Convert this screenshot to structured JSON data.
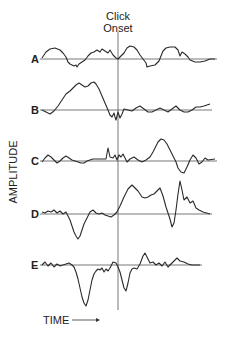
{
  "chart_data": {
    "type": "line",
    "title": "Click Onset",
    "title_lines": [
      "Click",
      "Onset"
    ],
    "xlabel": "TIME",
    "ylabel": "AMPLITUDE",
    "onset_x": 118,
    "onset_line": {
      "y1": 32,
      "y2": 310
    },
    "x_range": [
      28,
      220
    ],
    "grid": false,
    "legend": "none",
    "series": [
      {
        "name": "A",
        "baseline_y": 59,
        "points": [
          [
            42,
            58
          ],
          [
            46,
            52
          ],
          [
            50,
            49
          ],
          [
            55,
            48
          ],
          [
            60,
            50
          ],
          [
            63,
            53
          ],
          [
            66,
            57
          ],
          [
            68,
            62
          ],
          [
            70,
            64
          ],
          [
            72,
            65
          ],
          [
            74,
            66
          ],
          [
            76,
            65
          ],
          [
            77,
            67
          ],
          [
            79,
            64
          ],
          [
            82,
            62
          ],
          [
            85,
            60
          ],
          [
            88,
            56
          ],
          [
            91,
            53
          ],
          [
            94,
            52
          ],
          [
            97,
            50
          ],
          [
            100,
            52
          ],
          [
            102,
            49
          ],
          [
            105,
            51
          ],
          [
            108,
            53
          ],
          [
            110,
            50
          ],
          [
            113,
            55
          ],
          [
            116,
            58
          ],
          [
            118,
            59
          ],
          [
            121,
            56
          ],
          [
            124,
            53
          ],
          [
            127,
            48
          ],
          [
            130,
            46
          ],
          [
            134,
            47
          ],
          [
            137,
            50
          ],
          [
            140,
            55
          ],
          [
            143,
            59
          ],
          [
            146,
            63
          ],
          [
            147,
            67
          ],
          [
            150,
            66
          ],
          [
            155,
            65
          ],
          [
            159,
            61
          ],
          [
            161,
            56
          ],
          [
            163,
            51
          ],
          [
            166,
            48
          ],
          [
            170,
            47
          ],
          [
            175,
            47
          ],
          [
            178,
            50
          ],
          [
            180,
            56
          ],
          [
            182,
            52
          ],
          [
            185,
            54
          ],
          [
            188,
            57
          ],
          [
            190,
            60
          ],
          [
            195,
            62
          ],
          [
            200,
            62
          ],
          [
            205,
            61
          ],
          [
            210,
            59
          ],
          [
            215,
            59
          ]
        ]
      },
      {
        "name": "B",
        "baseline_y": 110,
        "points": [
          [
            42,
            110
          ],
          [
            46,
            112
          ],
          [
            50,
            114
          ],
          [
            54,
            111
          ],
          [
            58,
            106
          ],
          [
            62,
            100
          ],
          [
            66,
            94
          ],
          [
            70,
            91
          ],
          [
            73,
            88
          ],
          [
            76,
            85
          ],
          [
            79,
            83
          ],
          [
            82,
            85
          ],
          [
            85,
            87
          ],
          [
            88,
            86
          ],
          [
            91,
            83
          ],
          [
            94,
            82
          ],
          [
            96,
            84
          ],
          [
            99,
            89
          ],
          [
            102,
            96
          ],
          [
            105,
            103
          ],
          [
            108,
            110
          ],
          [
            110,
            115
          ],
          [
            112,
            117
          ],
          [
            114,
            113
          ],
          [
            115,
            117
          ],
          [
            116,
            120
          ],
          [
            118,
            112
          ],
          [
            120,
            118
          ],
          [
            122,
            114
          ],
          [
            124,
            109
          ],
          [
            128,
            110
          ],
          [
            132,
            111
          ],
          [
            136,
            108
          ],
          [
            140,
            106
          ],
          [
            144,
            109
          ],
          [
            148,
            112
          ],
          [
            152,
            112
          ],
          [
            156,
            110
          ],
          [
            160,
            108
          ],
          [
            164,
            110
          ],
          [
            168,
            112
          ],
          [
            172,
            109
          ],
          [
            176,
            106
          ],
          [
            180,
            110
          ],
          [
            184,
            112
          ],
          [
            188,
            112
          ],
          [
            192,
            110
          ],
          [
            196,
            107
          ],
          [
            200,
            107
          ],
          [
            204,
            106
          ],
          [
            210,
            104
          ]
        ]
      },
      {
        "name": "C",
        "baseline_y": 161,
        "points": [
          [
            42,
            162
          ],
          [
            45,
            158
          ],
          [
            48,
            155
          ],
          [
            51,
            157
          ],
          [
            54,
            160
          ],
          [
            57,
            163
          ],
          [
            60,
            161
          ],
          [
            63,
            158
          ],
          [
            66,
            156
          ],
          [
            69,
            158
          ],
          [
            72,
            160
          ],
          [
            75,
            161
          ],
          [
            78,
            162
          ],
          [
            81,
            163
          ],
          [
            84,
            163
          ],
          [
            87,
            161
          ],
          [
            90,
            160
          ],
          [
            93,
            159
          ],
          [
            106,
            159
          ],
          [
            108,
            148
          ],
          [
            110,
            157
          ],
          [
            113,
            158
          ],
          [
            115,
            155
          ],
          [
            117,
            160
          ],
          [
            119,
            155
          ],
          [
            121,
            157
          ],
          [
            123,
            154
          ],
          [
            125,
            158
          ],
          [
            127,
            162
          ],
          [
            130,
            159
          ],
          [
            134,
            157
          ],
          [
            138,
            160
          ],
          [
            142,
            162
          ],
          [
            146,
            160
          ],
          [
            150,
            157
          ],
          [
            153,
            152
          ],
          [
            156,
            146
          ],
          [
            158,
            142
          ],
          [
            161,
            139
          ],
          [
            164,
            140
          ],
          [
            167,
            144
          ],
          [
            170,
            150
          ],
          [
            173,
            156
          ],
          [
            176,
            162
          ],
          [
            178,
            168
          ],
          [
            181,
            172
          ],
          [
            184,
            173
          ],
          [
            187,
            167
          ],
          [
            190,
            160
          ],
          [
            193,
            155
          ],
          [
            196,
            158
          ],
          [
            199,
            164
          ],
          [
            202,
            162
          ],
          [
            205,
            158
          ],
          [
            208,
            160
          ],
          [
            215,
            159
          ]
        ]
      },
      {
        "name": "D",
        "baseline_y": 214,
        "points": [
          [
            42,
            212
          ],
          [
            45,
            213
          ],
          [
            48,
            211
          ],
          [
            51,
            212
          ],
          [
            54,
            210
          ],
          [
            57,
            213
          ],
          [
            60,
            211
          ],
          [
            63,
            214
          ],
          [
            66,
            212
          ],
          [
            68,
            216
          ],
          [
            70,
            220
          ],
          [
            72,
            226
          ],
          [
            74,
            232
          ],
          [
            76,
            236
          ],
          [
            78,
            239
          ],
          [
            80,
            236
          ],
          [
            82,
            230
          ],
          [
            84,
            224
          ],
          [
            86,
            220
          ],
          [
            88,
            216
          ],
          [
            90,
            212
          ],
          [
            93,
            210
          ],
          [
            96,
            213
          ],
          [
            99,
            214
          ],
          [
            102,
            213
          ],
          [
            105,
            215
          ],
          [
            108,
            216
          ],
          [
            111,
            217
          ],
          [
            114,
            215
          ],
          [
            117,
            212
          ],
          [
            120,
            206
          ],
          [
            124,
            197
          ],
          [
            128,
            189
          ],
          [
            132,
            185
          ],
          [
            135,
            188
          ],
          [
            138,
            191
          ],
          [
            142,
            197
          ],
          [
            145,
            198
          ],
          [
            148,
            197
          ],
          [
            151,
            195
          ],
          [
            154,
            194
          ],
          [
            157,
            191
          ],
          [
            160,
            188
          ],
          [
            163,
            196
          ],
          [
            166,
            207
          ],
          [
            168,
            213
          ],
          [
            170,
            219
          ],
          [
            172,
            227
          ],
          [
            174,
            223
          ],
          [
            176,
            210
          ],
          [
            178,
            194
          ],
          [
            180,
            181
          ],
          [
            182,
            190
          ],
          [
            184,
            200
          ],
          [
            187,
            197
          ],
          [
            190,
            203
          ],
          [
            193,
            201
          ],
          [
            196,
            208
          ],
          [
            199,
            210
          ],
          [
            203,
            212
          ],
          [
            210,
            214
          ]
        ]
      },
      {
        "name": "E",
        "baseline_y": 265,
        "points": [
          [
            42,
            265
          ],
          [
            45,
            262
          ],
          [
            48,
            266
          ],
          [
            51,
            263
          ],
          [
            54,
            267
          ],
          [
            57,
            264
          ],
          [
            60,
            266
          ],
          [
            63,
            265
          ],
          [
            66,
            264
          ],
          [
            69,
            263
          ],
          [
            72,
            265
          ],
          [
            74,
            267
          ],
          [
            76,
            272
          ],
          [
            78,
            279
          ],
          [
            80,
            288
          ],
          [
            82,
            297
          ],
          [
            84,
            303
          ],
          [
            86,
            306
          ],
          [
            88,
            300
          ],
          [
            90,
            290
          ],
          [
            92,
            280
          ],
          [
            94,
            274
          ],
          [
            96,
            271
          ],
          [
            98,
            269
          ],
          [
            100,
            270
          ],
          [
            102,
            268
          ],
          [
            104,
            272
          ],
          [
            106,
            269
          ],
          [
            108,
            271
          ],
          [
            110,
            268
          ],
          [
            113,
            262
          ],
          [
            116,
            263
          ],
          [
            118,
            267
          ],
          [
            120,
            272
          ],
          [
            122,
            280
          ],
          [
            124,
            288
          ],
          [
            126,
            291
          ],
          [
            128,
            283
          ],
          [
            130,
            273
          ],
          [
            132,
            269
          ],
          [
            134,
            268
          ],
          [
            137,
            269
          ],
          [
            140,
            264
          ],
          [
            143,
            256
          ],
          [
            145,
            253
          ],
          [
            147,
            257
          ],
          [
            150,
            263
          ],
          [
            153,
            262
          ],
          [
            156,
            265
          ],
          [
            159,
            263
          ],
          [
            162,
            266
          ],
          [
            165,
            262
          ],
          [
            168,
            267
          ],
          [
            171,
            264
          ],
          [
            174,
            261
          ],
          [
            177,
            258
          ],
          [
            180,
            261
          ],
          [
            184,
            262
          ],
          [
            188,
            264
          ],
          [
            192,
            265
          ],
          [
            200,
            265
          ]
        ]
      }
    ]
  },
  "labels": {
    "title_line1": "Click",
    "title_line2": "Onset",
    "ylabel": "AMPLITUDE",
    "xlabel": "TIME",
    "trace_A": "A",
    "trace_B": "B",
    "trace_C": "C",
    "trace_D": "D",
    "trace_E": "E"
  }
}
